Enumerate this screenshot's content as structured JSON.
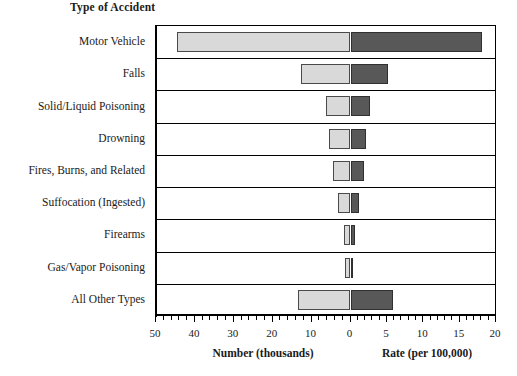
{
  "chart_data": {
    "type": "bar",
    "title": "Type of Accident",
    "orientation": "horizontal",
    "style": "bidirectional-paired-bars",
    "categories": [
      "Motor Vehicle",
      "Falls",
      "Solid/Liquid Poisoning",
      "Drowning",
      "Fires, Burns, and Related",
      "Suffocation (Ingested)",
      "Firearms",
      "Gas/Vapor Poisoning",
      "All Other Types"
    ],
    "series": [
      {
        "name": "Number (thousands)",
        "direction": "left",
        "color": "#d9d9d9",
        "values": [
          44.5,
          12.8,
          6.3,
          5.5,
          4.5,
          3.2,
          1.7,
          1.4,
          13.5
        ]
      },
      {
        "name": "Rate (per 100,000)",
        "direction": "right",
        "color": "#585858",
        "values": [
          18.1,
          5.2,
          2.7,
          2.1,
          1.9,
          1.2,
          0.6,
          0.4,
          5.9
        ]
      }
    ],
    "left_axis": {
      "label": "Number (thousands)",
      "ticks": [
        50,
        40,
        30,
        20,
        10,
        0
      ],
      "min": 0,
      "max": 50,
      "minor_tick_step": 2
    },
    "right_axis": {
      "label": "Rate (per 100,000)",
      "ticks": [
        0,
        5,
        10,
        15,
        20
      ],
      "min": 0,
      "max": 20,
      "minor_tick_step": 1
    },
    "xlabel_left": "Number (thousands)",
    "xlabel_right": "Rate (per 100,000)",
    "ylabel": "Type of Accident",
    "grid": false,
    "legend": "none"
  },
  "axis": {
    "left_tick_labels": [
      "50",
      "40",
      "30",
      "20",
      "10",
      "0"
    ],
    "right_tick_labels": [
      "5",
      "10",
      "15",
      "20"
    ]
  }
}
